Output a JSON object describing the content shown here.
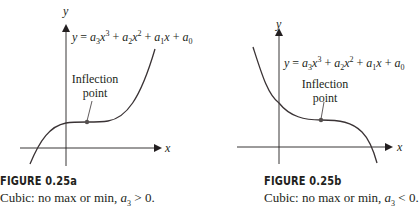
{
  "figures": [
    {
      "id": "a",
      "title": "FIGURE 0.25a",
      "caption_prefix": "Cubic: no max or min, ",
      "caption_var": "a",
      "caption_sub": "3",
      "caption_rel": " > 0.",
      "equation": {
        "lhs": "y",
        "terms": [
          "a",
          "3",
          "x",
          "3",
          " + ",
          "a",
          "2",
          "x",
          "2",
          " + ",
          "a",
          "1",
          "x",
          " + ",
          "a",
          "0"
        ]
      },
      "annotation": "Inflection point",
      "annotation_line1": "Inflection",
      "annotation_line2": "point",
      "x_axis_label": "x",
      "y_axis_label": "y"
    },
    {
      "id": "b",
      "title": "FIGURE 0.25b",
      "caption_prefix": "Cubic: no max or min, ",
      "caption_var": "a",
      "caption_sub": "3",
      "caption_rel": " < 0.",
      "annotation": "Inflection point",
      "annotation_line1": "Inflection",
      "annotation_line2": "point",
      "x_axis_label": "x",
      "y_axis_label": "y"
    }
  ],
  "colors": {
    "ink": "#231f20",
    "axis": "#231f20",
    "curve": "#3a3335",
    "point": "#55504f"
  }
}
